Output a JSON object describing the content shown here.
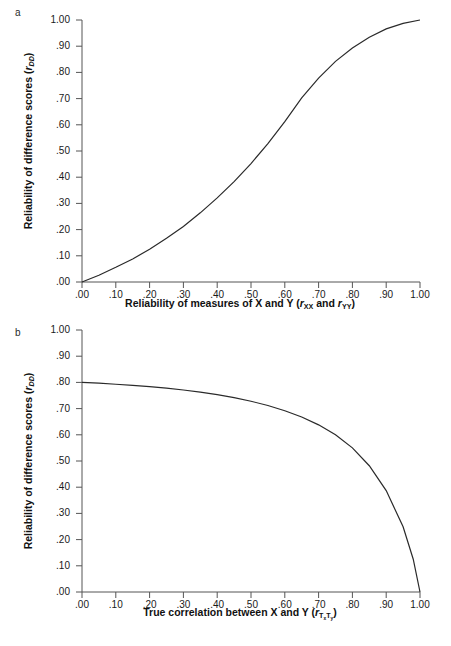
{
  "figure": {
    "background_color": "#ffffff",
    "line_color": "#2a2a2a",
    "axis_color": "#555555"
  },
  "panels": [
    {
      "letter": "a",
      "y_axis_title_prefix": "Reliability of difference scores (",
      "y_axis_title_symbol": "r",
      "y_axis_title_sub": "DD",
      "y_axis_title_suffix": ")",
      "x_axis_title_prefix": "Reliability of measures of X and Y (",
      "x_axis_title_symbol1": "r",
      "x_axis_title_sub1": "XX",
      "x_axis_title_mid": " and ",
      "x_axis_title_symbol2": "r",
      "x_axis_title_sub2": "YY",
      "x_axis_title_suffix": ")",
      "tick_labels": [
        "1.00",
        ".90",
        ".80",
        ".70",
        ".60",
        ".50",
        ".40",
        ".30",
        ".20",
        ".10",
        ".00"
      ],
      "x_tick_labels": [
        ".00",
        ".10",
        ".20",
        ".30",
        ".40",
        ".50",
        ".60",
        ".70",
        ".80",
        ".90",
        "1.00"
      ]
    },
    {
      "letter": "b",
      "y_axis_title_prefix": "Reliability of difference scores (",
      "y_axis_title_symbol": "r",
      "y_axis_title_sub": "DD",
      "y_axis_title_suffix": ")",
      "x_axis_title_prefix": "True correlation between X and Y (",
      "x_axis_title_symbol1": "r",
      "x_axis_title_sub1": "TxTy",
      "x_axis_title_suffix": ")",
      "tick_labels": [
        "1.00",
        ".90",
        ".80",
        ".70",
        ".60",
        ".50",
        ".40",
        ".30",
        ".20",
        ".10",
        ".00"
      ],
      "x_tick_labels": [
        ".00",
        ".10",
        ".20",
        ".30",
        ".40",
        ".50",
        ".60",
        ".70",
        ".80",
        ".90",
        "1.00"
      ]
    }
  ],
  "chart_data": [
    {
      "type": "line",
      "panel": "a",
      "title": "",
      "xlabel": "Reliability of measures of X and Y (rXX and rYY)",
      "ylabel": "Reliability of difference scores (rDD)",
      "xlim": [
        0.0,
        1.0
      ],
      "ylim": [
        0.0,
        1.0
      ],
      "xticks": [
        0.0,
        0.1,
        0.2,
        0.3,
        0.4,
        0.5,
        0.6,
        0.7,
        0.8,
        0.9,
        1.0
      ],
      "yticks": [
        0.0,
        0.1,
        0.2,
        0.3,
        0.4,
        0.5,
        0.6,
        0.7,
        0.8,
        0.9,
        1.0
      ],
      "grid": false,
      "legend": false,
      "series": [
        {
          "name": "Reliability of difference scores",
          "x": [
            0.0,
            0.05,
            0.1,
            0.15,
            0.2,
            0.25,
            0.3,
            0.35,
            0.4,
            0.45,
            0.5,
            0.55,
            0.6,
            0.65,
            0.7,
            0.75,
            0.8,
            0.85,
            0.9,
            0.95,
            1.0
          ],
          "y": [
            0.0,
            0.026,
            0.056,
            0.088,
            0.125,
            0.167,
            0.212,
            0.264,
            0.321,
            0.383,
            0.452,
            0.528,
            0.612,
            0.703,
            0.778,
            0.842,
            0.893,
            0.934,
            0.966,
            0.987,
            1.0
          ]
        }
      ]
    },
    {
      "type": "line",
      "panel": "b",
      "title": "",
      "xlabel": "True correlation between X and Y (rTxTy)",
      "ylabel": "Reliability of difference scores (rDD)",
      "xlim": [
        0.0,
        1.0
      ],
      "ylim": [
        0.0,
        1.0
      ],
      "xticks": [
        0.0,
        0.1,
        0.2,
        0.3,
        0.4,
        0.5,
        0.6,
        0.7,
        0.8,
        0.9,
        1.0
      ],
      "yticks": [
        0.0,
        0.1,
        0.2,
        0.3,
        0.4,
        0.5,
        0.6,
        0.7,
        0.8,
        0.9,
        1.0
      ],
      "grid": false,
      "legend": false,
      "series": [
        {
          "name": "Reliability of difference scores",
          "x": [
            0.0,
            0.05,
            0.1,
            0.15,
            0.2,
            0.25,
            0.3,
            0.35,
            0.4,
            0.45,
            0.5,
            0.55,
            0.6,
            0.65,
            0.7,
            0.75,
            0.8,
            0.85,
            0.9,
            0.95,
            0.98,
            1.0
          ],
          "y": [
            0.8,
            0.797,
            0.793,
            0.789,
            0.784,
            0.778,
            0.771,
            0.763,
            0.753,
            0.742,
            0.728,
            0.712,
            0.692,
            0.668,
            0.638,
            0.6,
            0.55,
            0.482,
            0.387,
            0.249,
            0.125,
            0.0
          ]
        }
      ]
    }
  ]
}
